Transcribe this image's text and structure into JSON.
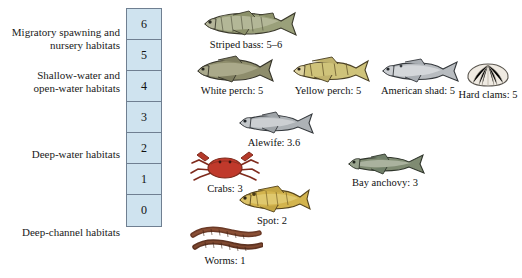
{
  "habitats": [
    {
      "id": "migratory",
      "text_line1": "Migratory spawning and",
      "text_line2": "nursery habitats"
    },
    {
      "id": "shallow",
      "text_line1": "Shallow-water and",
      "text_line2": "open-water habitats"
    },
    {
      "id": "deepwater",
      "text_line1": "Deep-water habitats",
      "text_line2": ""
    },
    {
      "id": "deepchannel",
      "text_line1": "Deep-channel habitats",
      "text_line2": ""
    }
  ],
  "scale": {
    "name": "salinity-scale",
    "values": [
      "6",
      "5",
      "4",
      "3",
      "2",
      "1",
      "0"
    ],
    "fill_color": "#cfe3ef",
    "border_color": "#6f7f91"
  },
  "organisms": [
    {
      "id": "striped-bass",
      "label": "Striped bass: 5–6",
      "value": "5–6"
    },
    {
      "id": "white-perch",
      "label": "White perch: 5",
      "value": "5"
    },
    {
      "id": "yellow-perch",
      "label": "Yellow perch: 5",
      "value": "5"
    },
    {
      "id": "american-shad",
      "label": "American shad: 5",
      "value": "5"
    },
    {
      "id": "hard-clams",
      "label": "Hard clams: 5",
      "value": "5"
    },
    {
      "id": "alewife",
      "label": "Alewife: 3.6",
      "value": "3.6"
    },
    {
      "id": "crabs",
      "label": "Crabs: 3",
      "value": "3"
    },
    {
      "id": "bay-anchovy",
      "label": "Bay anchovy: 3",
      "value": "3"
    },
    {
      "id": "spot",
      "label": "Spot: 2",
      "value": "2"
    },
    {
      "id": "worms",
      "label": "Worms: 1",
      "value": "1"
    }
  ],
  "colors": {
    "scale_fill": "#cfe3ef",
    "scale_border": "#6f7f91",
    "crab_red": "#c0392b",
    "spot_yellow": "#d4b24a",
    "worm_brown": "#6b3a27",
    "fish_olive": "#8a8f5c",
    "fish_silver": "#b9bdc2"
  }
}
